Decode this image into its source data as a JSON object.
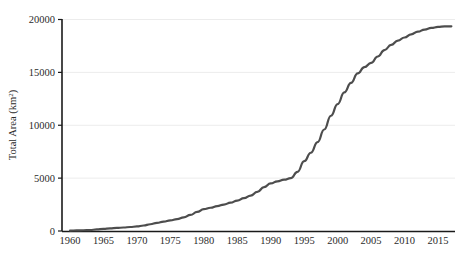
{
  "chart_data": {
    "type": "line",
    "title": "",
    "subtitle": "",
    "xlabel": "",
    "ylabel": "Total Area (km²)",
    "ylabel_base": "Total Area (km",
    "ylabel_sup": "2",
    "ylabel_close": ")",
    "xlim": [
      1960,
      2018
    ],
    "ylim": [
      0,
      20000
    ],
    "grid": "horizontal",
    "legend": "none",
    "line_color": "#4d4d4d",
    "axis_color": "#1a1a1a",
    "grid_color": "#ececec",
    "background": "#ffffff",
    "x_ticks": [
      1960,
      1965,
      1970,
      1975,
      1980,
      1985,
      1990,
      1995,
      2000,
      2005,
      2010,
      2015
    ],
    "x_tick_labels": [
      "1960",
      "1965",
      "1970",
      "1975",
      "1980",
      "1985",
      "1990",
      "1995",
      "2000",
      "2005",
      "2010",
      "2015"
    ],
    "y_ticks": [
      0,
      5000,
      10000,
      15000,
      20000
    ],
    "y_tick_labels": [
      "0",
      "5000",
      "10000",
      "15000",
      "20000"
    ],
    "x": [
      1960,
      1961,
      1962,
      1963,
      1964,
      1965,
      1966,
      1967,
      1968,
      1969,
      1970,
      1971,
      1972,
      1973,
      1974,
      1975,
      1976,
      1977,
      1978,
      1979,
      1980,
      1981,
      1982,
      1983,
      1984,
      1985,
      1986,
      1987,
      1988,
      1989,
      1990,
      1991,
      1992,
      1993,
      1994,
      1995,
      1996,
      1997,
      1998,
      1999,
      2000,
      2001,
      2002,
      2003,
      2004,
      2005,
      2006,
      2007,
      2008,
      2009,
      2010,
      2011,
      2012,
      2013,
      2014,
      2015,
      2016,
      2017
    ],
    "values": [
      40,
      55,
      70,
      90,
      150,
      210,
      250,
      290,
      330,
      380,
      430,
      520,
      640,
      760,
      880,
      1000,
      1120,
      1280,
      1520,
      1800,
      2060,
      2200,
      2350,
      2500,
      2680,
      2880,
      3100,
      3350,
      3700,
      4150,
      4500,
      4700,
      4850,
      5000,
      5600,
      6600,
      7400,
      8400,
      9600,
      10900,
      12000,
      13100,
      14000,
      14900,
      15500,
      15900,
      16500,
      17100,
      17600,
      18000,
      18300,
      18600,
      18850,
      19050,
      19200,
      19300,
      19350,
      19350
    ],
    "series_name": "Total Area",
    "annotations": []
  },
  "axis_titles": {
    "y": "Total Area (km²)"
  }
}
